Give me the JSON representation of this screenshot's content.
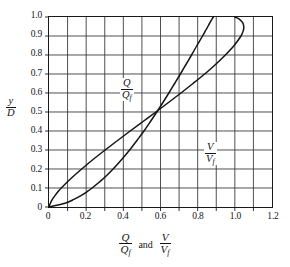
{
  "chart_data": {
    "type": "line",
    "title": "",
    "subtitle": "",
    "xlabel": "Q/Qf and V/Vf",
    "ylabel": "y/D",
    "xlim": [
      0,
      1.2
    ],
    "ylim": [
      0,
      1.0
    ],
    "grid": true,
    "x_major_step": 0.2,
    "x_minor_step": 0.1,
    "y_step": 0.1,
    "legend_position": "inline-curve-labels",
    "x_ticks": [
      "0",
      "0.2",
      "0.4",
      "0.6",
      "0.8",
      "1.0",
      "1.2"
    ],
    "x_tick_values": [
      0,
      0.2,
      0.4,
      0.6,
      0.8,
      1.0,
      1.2
    ],
    "y_ticks": [
      "0",
      "0.1",
      "0.2",
      "0.3",
      "0.4",
      "0.5",
      "0.6",
      "0.7",
      "0.8",
      "0.9",
      "1.0"
    ],
    "y_tick_values": [
      0,
      0.1,
      0.2,
      0.3,
      0.4,
      0.5,
      0.6,
      0.7,
      0.8,
      0.9,
      1.0
    ],
    "series": [
      {
        "name": "Q/Qf",
        "label_num": "Q",
        "label_den": "Q",
        "label_den_sub": "f",
        "y": [
          0.0,
          0.02,
          0.04,
          0.06,
          0.08,
          0.1,
          0.15,
          0.2,
          0.25,
          0.3,
          0.35,
          0.4,
          0.45,
          0.5,
          0.55,
          0.6,
          0.65,
          0.7,
          0.75,
          0.8,
          0.85,
          0.9,
          0.93,
          0.95,
          0.97,
          0.99,
          1.0
        ],
        "x": [
          0.0,
          0.007,
          0.018,
          0.032,
          0.048,
          0.066,
          0.118,
          0.176,
          0.237,
          0.302,
          0.369,
          0.437,
          0.506,
          0.575,
          0.643,
          0.71,
          0.775,
          0.838,
          0.896,
          0.949,
          0.996,
          1.033,
          1.046,
          1.048,
          1.042,
          1.022,
          1.0
        ]
      },
      {
        "name": "V/Vf",
        "label_num": "V",
        "label_den": "V",
        "label_den_sub": "f",
        "y": [
          0.0,
          0.02,
          0.04,
          0.06,
          0.08,
          0.1,
          0.15,
          0.2,
          0.25,
          0.3,
          0.35,
          0.4,
          0.45,
          0.5,
          0.55,
          0.6,
          0.65,
          0.7,
          0.75,
          0.8,
          0.85,
          0.9,
          0.93,
          0.95,
          0.97,
          0.99,
          1.0
        ],
        "x": [
          0.0,
          0.086,
          0.134,
          0.172,
          0.204,
          0.232,
          0.293,
          0.345,
          0.391,
          0.434,
          0.473,
          0.511,
          0.546,
          0.58,
          0.613,
          0.645,
          0.676,
          0.707,
          0.737,
          0.767,
          0.796,
          0.826,
          0.843,
          0.855,
          0.866,
          0.878,
          0.885
        ]
      }
    ],
    "axis_label_parts": {
      "x_first_num": "Q",
      "x_first_den": "Q",
      "x_first_den_sub": "f",
      "x_conjunction": "and",
      "x_second_num": "V",
      "x_second_den": "V",
      "x_second_den_sub": "f",
      "y_num": "y",
      "y_den": "D"
    },
    "colors": {
      "curve": "#141414",
      "grid": "#3c3c3c",
      "frame": "#1a1a1a",
      "background": "#ffffff",
      "text": "#141414"
    }
  }
}
